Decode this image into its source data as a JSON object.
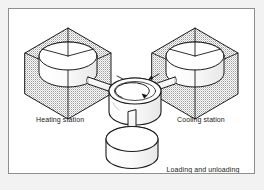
{
  "figure": {
    "frame": {
      "border_color": "#8e8e8e",
      "page_background": "#f2f2f2",
      "panel_background": "#ffffff"
    },
    "ink_color": "#1a1a1a",
    "shade_color": "#b9b9b9"
  },
  "stations": {
    "heating": {
      "label": "Heating station",
      "enclosure": "isometric-cube-shaded",
      "workpiece": "cylinder"
    },
    "cooling": {
      "label": "Cooling station",
      "enclosure": "isometric-cube-shaded",
      "workpiece": "cylinder"
    },
    "loading": {
      "label_line1": "Loading and unloading",
      "label_line2": "station",
      "enclosure": "none",
      "workpiece": "cylinder"
    }
  },
  "center": {
    "name": "rotary index table",
    "rotation_indicator": "curved-arrow-counterclockwise"
  },
  "arms": [
    {
      "name": "arm-to-heating-station",
      "direction": "left",
      "arrow": "inward"
    },
    {
      "name": "arm-to-cooling-station",
      "direction": "right",
      "arrow": "inward"
    },
    {
      "name": "arm-to-loading-station",
      "direction": "down",
      "arrow": "none"
    }
  ]
}
